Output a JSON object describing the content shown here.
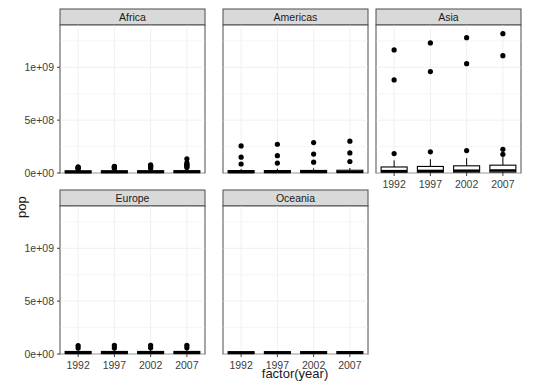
{
  "chart_data": {
    "type": "box",
    "title": "",
    "xlabel": "factor(year)",
    "ylabel": "pop",
    "ylim": [
      0,
      1400000000
    ],
    "y_ticks": [
      0,
      500000000,
      1000000000
    ],
    "y_tick_labels": [
      "0e+00",
      "5e+08",
      "1e+09"
    ],
    "categories": [
      "1992",
      "1997",
      "2002",
      "2007"
    ],
    "facet_var": "continent",
    "facets": [
      "Africa",
      "Americas",
      "Asia",
      "Europe",
      "Oceania"
    ],
    "grid": true,
    "legend": "none",
    "panels": [
      {
        "name": "Africa",
        "row": 0,
        "col": 0,
        "groups": [
          {
            "category": "1992",
            "min": 1050000,
            "q1": 2500000,
            "median": 7500000,
            "q3": 14500000,
            "max": 30000000,
            "outliers": [
              39000000,
              48000000,
              52000000,
              57000000
            ]
          },
          {
            "category": "1997",
            "min": 1150000,
            "q1": 2800000,
            "median": 8400000,
            "q3": 16000000,
            "max": 34000000,
            "outliers": [
              43000000,
              53000000,
              60000000,
              64000000
            ]
          },
          {
            "category": "2002",
            "min": 1250000,
            "q1": 3100000,
            "median": 9200000,
            "q3": 17500000,
            "max": 38000000,
            "outliers": [
              46000000,
              58000000,
              67000000,
              70000000,
              76000000
            ]
          },
          {
            "category": "2007",
            "min": 1450000,
            "q1": 3500000,
            "median": 10100000,
            "q3": 19000000,
            "max": 42000000,
            "outliers": [
              51000000,
              65000000,
              76000000,
              82000000,
              96000000,
              135000000
            ]
          }
        ]
      },
      {
        "name": "Americas",
        "row": 0,
        "col": 1,
        "groups": [
          {
            "category": "1992",
            "min": 250000,
            "q1": 4000000,
            "median": 8000000,
            "q3": 20000000,
            "max": 38000000,
            "outliers": [
              85000000,
              150000000,
              256000000
            ]
          },
          {
            "category": "1997",
            "min": 270000,
            "q1": 4300000,
            "median": 8700000,
            "q3": 22000000,
            "max": 41000000,
            "outliers": [
              94000000,
              164000000,
              272000000
            ]
          },
          {
            "category": "2002",
            "min": 290000,
            "q1": 4600000,
            "median": 9400000,
            "q3": 24000000,
            "max": 44000000,
            "outliers": [
              102000000,
              179000000,
              288000000
            ]
          },
          {
            "category": "2007",
            "min": 300000,
            "q1": 4900000,
            "median": 10000000,
            "q3": 26000000,
            "max": 47000000,
            "outliers": [
              109000000,
              190000000,
              301000000
            ]
          }
        ]
      },
      {
        "name": "Asia",
        "row": 0,
        "col": 2,
        "groups": [
          {
            "category": "1992",
            "min": 400000,
            "q1": 7000000,
            "median": 18000000,
            "q3": 57000000,
            "max": 120000000,
            "outliers": [
              184000000,
              880000000,
              1164000000
            ]
          },
          {
            "category": "1997",
            "min": 500000,
            "q1": 7600000,
            "median": 20000000,
            "q3": 62000000,
            "max": 130000000,
            "outliers": [
              200000000,
              959000000,
              1230000000
            ]
          },
          {
            "category": "2002",
            "min": 600000,
            "q1": 8300000,
            "median": 22000000,
            "q3": 68000000,
            "max": 140000000,
            "outliers": [
              212000000,
              1034000000,
              1280000000
            ]
          },
          {
            "category": "2007",
            "min": 700000,
            "q1": 9000000,
            "median": 24000000,
            "q3": 74000000,
            "max": 150000000,
            "outliers": [
              177000000,
              224000000,
              1110000000,
              1318000000
            ]
          }
        ]
      },
      {
        "name": "Europe",
        "row": 1,
        "col": 0,
        "groups": [
          {
            "category": "1992",
            "min": 340000,
            "q1": 5000000,
            "median": 9200000,
            "q3": 15000000,
            "max": 39000000,
            "outliers": [
              57000000,
              80000000
            ]
          },
          {
            "category": "1997",
            "min": 350000,
            "q1": 5100000,
            "median": 9400000,
            "q3": 15500000,
            "max": 40000000,
            "outliers": [
              57000000,
              82000000
            ]
          },
          {
            "category": "2002",
            "min": 360000,
            "q1": 5200000,
            "median": 9500000,
            "q3": 16000000,
            "max": 40500000,
            "outliers": [
              58000000,
              82000000
            ]
          },
          {
            "category": "2007",
            "min": 380000,
            "q1": 5300000,
            "median": 9600000,
            "q3": 16500000,
            "max": 41000000,
            "outliers": [
              60000000,
              82000000
            ]
          }
        ]
      },
      {
        "name": "Oceania",
        "row": 1,
        "col": 1,
        "groups": [
          {
            "category": "1992",
            "min": 3400000,
            "q1": 3400000,
            "median": 10750000,
            "q3": 17500000,
            "max": 17500000,
            "outliers": []
          },
          {
            "category": "1997",
            "min": 3670000,
            "q1": 3670000,
            "median": 11500000,
            "q3": 18500000,
            "max": 18500000,
            "outliers": []
          },
          {
            "category": "2002",
            "min": 3910000,
            "q1": 3910000,
            "median": 12000000,
            "q3": 19500000,
            "max": 19500000,
            "outliers": []
          },
          {
            "category": "2007",
            "min": 4120000,
            "q1": 4120000,
            "median": 12500000,
            "q3": 20400000,
            "max": 20400000,
            "outliers": []
          }
        ]
      }
    ]
  },
  "style": {
    "panel_bg": "#ffffff",
    "panel_border": "#4d4d4d",
    "strip_bg": "#d9d9d9",
    "grid_color": "#f0f0f0",
    "ink": "#000000",
    "tick_color": "#3d3d3d"
  }
}
